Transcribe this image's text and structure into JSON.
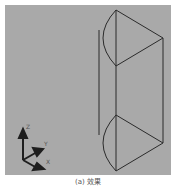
{
  "viewport": {
    "background": "#a9a9a9",
    "line_color": "#2b2b2b",
    "axis_gizmo": {
      "labels": {
        "z": "Z",
        "y": "Y",
        "x": "X"
      }
    },
    "object": "extruded semicircle-plus-triangle profile (wireframe)"
  },
  "caption": "(a) 效果"
}
